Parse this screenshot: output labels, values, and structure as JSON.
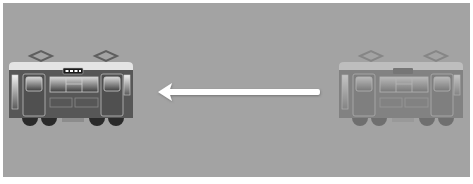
{
  "scene": {
    "description": "Tram moving left illustration",
    "background_color": "#a3a3a3",
    "frame_color": "#ffffff"
  },
  "trams": [
    {
      "id": "tram-current",
      "role": "destination",
      "opacity": 1.0,
      "label": "Tram (solid)"
    },
    {
      "id": "tram-ghost",
      "role": "origin",
      "opacity": 0.42,
      "label": "Tram (faded)"
    }
  ],
  "arrow": {
    "direction": "left",
    "color": "#ffffff",
    "label": "Movement direction"
  },
  "colors": {
    "roof": "#e6e6e6",
    "body": "#555555",
    "window_top": "#bdbdbd",
    "window_bottom": "#454545",
    "wheel": "#2b2b2b",
    "pantograph": "#6a6a6a"
  }
}
